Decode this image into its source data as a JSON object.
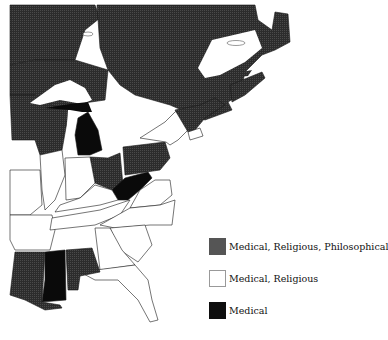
{
  "map": {
    "description": "Eastern United States and southeastern Canada with states shaded by exemption category",
    "colors": {
      "medical_religious_philosophical": "#3d3d3d",
      "medical_religious": "#ffffff",
      "medical": "#0b0b0b",
      "canada": "#2e2e2e",
      "water": "#ffffff",
      "border": "#1a1a1a"
    },
    "regions": [
      {
        "name": "Ontario/Quebec (Canada)",
        "category": "canada"
      },
      {
        "name": "Minnesota",
        "category": "medical_religious_philosophical"
      },
      {
        "name": "Wisconsin",
        "category": "medical_religious_philosophical"
      },
      {
        "name": "Michigan",
        "category": "medical"
      },
      {
        "name": "Ohio",
        "category": "medical_religious_philosophical"
      },
      {
        "name": "Pennsylvania",
        "category": "medical_religious_philosophical"
      },
      {
        "name": "West Virginia",
        "category": "medical"
      },
      {
        "name": "New York",
        "category": "medical_religious"
      },
      {
        "name": "Vermont",
        "category": "medical_religious_philosophical"
      },
      {
        "name": "Maine",
        "category": "medical_religious_philosophical"
      },
      {
        "name": "Illinois",
        "category": "medical_religious"
      },
      {
        "name": "Indiana",
        "category": "medical_religious"
      },
      {
        "name": "Kentucky",
        "category": "medical_religious"
      },
      {
        "name": "Tennessee",
        "category": "medical_religious"
      },
      {
        "name": "Missouri",
        "category": "medical_religious"
      },
      {
        "name": "Arkansas",
        "category": "medical_religious"
      },
      {
        "name": "Mississippi",
        "category": "medical"
      },
      {
        "name": "Louisiana",
        "category": "medical_religious_philosophical"
      },
      {
        "name": "Alabama",
        "category": "medical_religious_philosophical"
      },
      {
        "name": "Georgia",
        "category": "medical_religious"
      },
      {
        "name": "Florida",
        "category": "medical_religious"
      },
      {
        "name": "South Carolina",
        "category": "medical_religious"
      },
      {
        "name": "North Carolina",
        "category": "medical_religious"
      },
      {
        "name": "Virginia",
        "category": "medical_religious"
      }
    ]
  },
  "legend": {
    "items": [
      {
        "label": "Medical, Religious, Philosophical",
        "color": "#555555",
        "border": "#555555"
      },
      {
        "label": "Medical, Religious",
        "color": "#ffffff",
        "border": "#999999"
      },
      {
        "label": "Medical",
        "color": "#0e0e0e",
        "border": "#0e0e0e"
      }
    ]
  }
}
